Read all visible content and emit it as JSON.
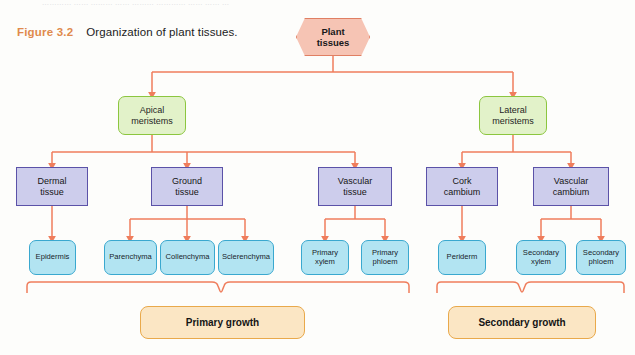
{
  "page": {
    "top_cut_text": "…………  ……  ……… ……  ………  ………… ……  ……  …",
    "background_color": "#fdfdfb"
  },
  "caption": {
    "figure_number": "Figure 3.2",
    "text": "Organization of plant tissues.",
    "number_color": "#e08a4c"
  },
  "palette": {
    "connector": "#ef7d5c",
    "hex_fill": "#f6c4b4",
    "hex_border": "#e07f63",
    "green_fill": "#e2f2c9",
    "green_border": "#8cc63f",
    "purple_fill": "#cdcdec",
    "purple_border": "#5b52a8",
    "cyan_fill": "#b2e4f2",
    "cyan_border": "#3aa8cf",
    "tan_fill": "#fbe6c4",
    "tan_border": "#e9a94b"
  },
  "diagram": {
    "type": "hierarchy-flowchart",
    "root": {
      "label": "Plant\ntissues",
      "label_line1": "Plant",
      "label_line2": "tissues",
      "shape": "hexagon"
    },
    "level2": [
      {
        "id": "apical-meristems",
        "line1": "Apical",
        "line2": "meristems"
      },
      {
        "id": "lateral-meristems",
        "line1": "Lateral",
        "line2": "meristems"
      }
    ],
    "level3": [
      {
        "id": "dermal-tissue",
        "line1": "Dermal",
        "line2": "tissue",
        "parent": "apical-meristems"
      },
      {
        "id": "ground-tissue",
        "line1": "Ground",
        "line2": "tissue",
        "parent": "apical-meristems"
      },
      {
        "id": "vascular-tissue",
        "line1": "Vascular",
        "line2": "tissue",
        "parent": "apical-meristems"
      },
      {
        "id": "cork-cambium",
        "line1": "Cork",
        "line2": "cambium",
        "parent": "lateral-meristems"
      },
      {
        "id": "vascular-cambium",
        "line1": "Vascular",
        "line2": "cambium",
        "parent": "lateral-meristems"
      }
    ],
    "level4": [
      {
        "id": "epidermis",
        "line1": "Epidermis",
        "line2": "",
        "parent": "dermal-tissue"
      },
      {
        "id": "parenchyma",
        "line1": "Parenchyma",
        "line2": "",
        "parent": "ground-tissue"
      },
      {
        "id": "collenchyma",
        "line1": "Collenchyma",
        "line2": "",
        "parent": "ground-tissue"
      },
      {
        "id": "sclerenchyma",
        "line1": "Sclerenchyma",
        "line2": "",
        "parent": "ground-tissue"
      },
      {
        "id": "primary-xylem",
        "line1": "Primary",
        "line2": "xylem",
        "parent": "vascular-tissue"
      },
      {
        "id": "primary-phloem",
        "line1": "Primary",
        "line2": "phloem",
        "parent": "vascular-tissue"
      },
      {
        "id": "periderm",
        "line1": "Periderm",
        "line2": "",
        "parent": "cork-cambium"
      },
      {
        "id": "secondary-xylem",
        "line1": "Secondary",
        "line2": "xylem",
        "parent": "vascular-cambium"
      },
      {
        "id": "secondary-phloem",
        "line1": "Secondary",
        "line2": "phloem",
        "parent": "vascular-cambium"
      }
    ],
    "outcomes": [
      {
        "id": "primary-growth",
        "label": "Primary growth"
      },
      {
        "id": "secondary-growth",
        "label": "Secondary growth"
      }
    ]
  }
}
